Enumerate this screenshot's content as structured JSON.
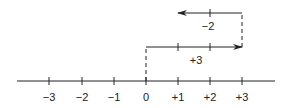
{
  "diagram": {
    "type": "number-line-addition",
    "axis": {
      "ticks": [
        {
          "value": -3,
          "label": "−3",
          "x": 49
        },
        {
          "value": -2,
          "label": "−2",
          "x": 82
        },
        {
          "value": -1,
          "label": "−1",
          "x": 114
        },
        {
          "value": 0,
          "label": "0",
          "x": 146
        },
        {
          "value": 1,
          "label": "+1",
          "x": 178
        },
        {
          "value": 2,
          "label": "+2",
          "x": 210
        },
        {
          "value": 3,
          "label": "+3",
          "x": 242
        }
      ]
    },
    "moves": [
      {
        "label": "+3",
        "from": 0,
        "to": 3,
        "direction": "right"
      },
      {
        "label": "−2",
        "from": 3,
        "to": 1,
        "direction": "left"
      }
    ],
    "colors": {
      "line": "#222222",
      "background": "#ffffff"
    }
  }
}
